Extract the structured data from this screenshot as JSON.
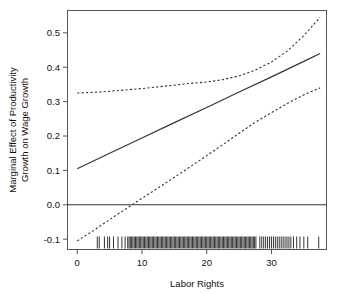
{
  "chart_data": {
    "type": "line",
    "title": "",
    "xlabel": "Labor Rights",
    "ylabel": "Marginal Effect of Productivity Growth on Wage Growth",
    "ylabel_line1": "Marginal Effect of Productivity",
    "ylabel_line2": "Growth on Wage Growth",
    "xlim": [
      -1.5,
      38.5
    ],
    "ylim": [
      -0.13,
      0.565
    ],
    "xticks": [
      0,
      10,
      20,
      30
    ],
    "xticklabels": [
      "0",
      "10",
      "20",
      "30"
    ],
    "yticks": [
      -0.1,
      0.0,
      0.1,
      0.2,
      0.3,
      0.4,
      0.5
    ],
    "yticklabels": [
      "-0.1",
      "0.0",
      "0.1",
      "0.2",
      "0.3",
      "0.4",
      "0.5"
    ],
    "grid": false,
    "legend": "none",
    "reference_line": {
      "name": "zero-line",
      "y": 0.0,
      "style": "solid",
      "color": "#333333"
    },
    "series": [
      {
        "name": "Marginal effect estimate",
        "style": "solid",
        "color": "#333333",
        "x": [
          0,
          5,
          10,
          15,
          20,
          25,
          30,
          35,
          37.5
        ],
        "values": [
          0.105,
          0.15,
          0.194,
          0.239,
          0.283,
          0.328,
          0.372,
          0.417,
          0.44
        ]
      },
      {
        "name": "Upper 95% confidence bound",
        "style": "dashed",
        "color": "#333333",
        "x": [
          0,
          2.5,
          5,
          7.5,
          10,
          12.5,
          15,
          17.5,
          20,
          22.5,
          25,
          27.5,
          30,
          32.5,
          35,
          37.5
        ],
        "values": [
          0.325,
          0.327,
          0.33,
          0.334,
          0.338,
          0.343,
          0.348,
          0.353,
          0.357,
          0.364,
          0.375,
          0.392,
          0.415,
          0.448,
          0.492,
          0.545
        ]
      },
      {
        "name": "Lower 95% confidence bound",
        "style": "dashed",
        "color": "#333333",
        "x": [
          0,
          2.5,
          5,
          7.5,
          10,
          12.5,
          15,
          17.5,
          20,
          22.5,
          25,
          27.5,
          30,
          32.5,
          35,
          37.5
        ],
        "values": [
          -0.105,
          -0.075,
          -0.043,
          -0.012,
          0.019,
          0.049,
          0.08,
          0.111,
          0.143,
          0.175,
          0.208,
          0.24,
          0.268,
          0.295,
          0.32,
          0.34
        ]
      }
    ],
    "rug": {
      "name": "data-distribution-rug",
      "description": "Rug plot of Labor Rights observations along bottom axis",
      "values": [
        3.1,
        3.4,
        4.2,
        4.7,
        5.0,
        5.6,
        6.3,
        6.9,
        7.4,
        7.8,
        8.0,
        8.2,
        8.4,
        8.6,
        8.8,
        9.0,
        9.2,
        9.4,
        9.6,
        9.8,
        10.0,
        10.2,
        10.4,
        10.6,
        10.8,
        11.0,
        11.2,
        11.4,
        11.6,
        11.8,
        12.0,
        12.2,
        12.4,
        12.6,
        12.8,
        13.0,
        13.2,
        13.4,
        13.6,
        13.8,
        14.0,
        14.2,
        14.4,
        14.6,
        14.8,
        15.0,
        15.2,
        15.4,
        15.6,
        15.8,
        16.0,
        16.2,
        16.4,
        16.6,
        16.8,
        17.0,
        17.2,
        17.4,
        17.6,
        17.8,
        18.0,
        18.2,
        18.4,
        18.6,
        18.8,
        19.0,
        19.2,
        19.4,
        19.6,
        19.8,
        20.0,
        20.2,
        20.4,
        20.6,
        20.8,
        21.0,
        21.2,
        21.4,
        21.6,
        21.8,
        22.0,
        22.2,
        22.4,
        22.6,
        22.8,
        23.0,
        23.2,
        23.4,
        23.6,
        23.8,
        24.0,
        24.2,
        24.4,
        24.6,
        24.8,
        25.0,
        25.2,
        25.4,
        25.6,
        25.8,
        26.0,
        26.2,
        26.4,
        26.6,
        26.8,
        27.0,
        27.2,
        27.4,
        27.6,
        28.2,
        28.5,
        28.8,
        29.1,
        29.4,
        29.7,
        30.0,
        30.3,
        30.6,
        30.9,
        31.2,
        31.5,
        31.8,
        32.1,
        32.4,
        32.7,
        33.0,
        33.4,
        33.9,
        34.4,
        35.0,
        35.6,
        37.3
      ]
    }
  }
}
